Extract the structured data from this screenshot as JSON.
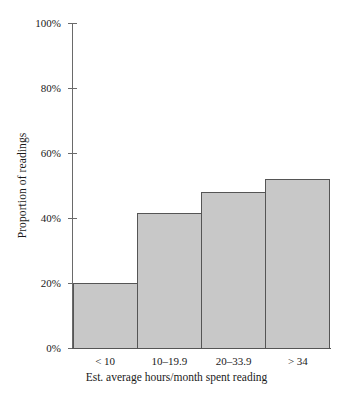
{
  "chart_data": {
    "type": "bar",
    "title": "",
    "categories": [
      "< 10",
      "10–19.9",
      "20–33.9",
      "> 34"
    ],
    "values": [
      20,
      41.5,
      48,
      52
    ],
    "value_labels": [
      "20%",
      "41.5%",
      "48%",
      "52%"
    ],
    "xlabel": "Est. average hours/month spent reading",
    "ylabel": "Proportion of readings",
    "ylim": [
      0,
      100
    ],
    "yticks": [
      0,
      20,
      40,
      60,
      80,
      100
    ],
    "ytick_labels": [
      "0%",
      "20%",
      "40%",
      "60%",
      "80%",
      "100%"
    ],
    "grid": false,
    "legend": false,
    "bar_fill_color": "#c8c8c8",
    "bar_border_color": "#555555",
    "axis_color": "#6a6a6a",
    "background_color": "#ffffff"
  }
}
